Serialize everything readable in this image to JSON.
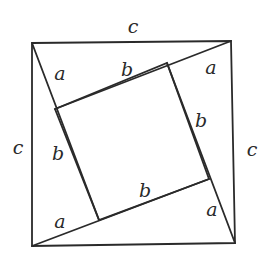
{
  "diagram": {
    "title": "",
    "stroke_color": "#2a2a2a",
    "background": "#ffffff",
    "outer_square": {
      "corners": [
        [
          32,
          43
        ],
        [
          231,
          41
        ],
        [
          235,
          243
        ],
        [
          32,
          246
        ]
      ]
    },
    "inner_square": {
      "corners": [
        [
          55,
          109
        ],
        [
          167,
          63
        ],
        [
          209,
          179
        ],
        [
          99,
          220
        ]
      ]
    },
    "segments": [
      {
        "name": "diag-top-left",
        "from": [
          32,
          43
        ],
        "to": [
          99,
          220
        ]
      },
      {
        "name": "diag-top-right",
        "from": [
          231,
          41
        ],
        "to": [
          55,
          109
        ]
      },
      {
        "name": "diag-right",
        "from": [
          167,
          63
        ],
        "to": [
          235,
          243
        ]
      },
      {
        "name": "diag-bottom",
        "from": [
          32,
          246
        ],
        "to": [
          209,
          179
        ]
      }
    ],
    "labels": [
      {
        "name": "label-c-top",
        "text": "c",
        "x": 133,
        "y": 33
      },
      {
        "name": "label-c-left",
        "text": "c",
        "x": 18,
        "y": 154
      },
      {
        "name": "label-c-right",
        "text": "c",
        "x": 252,
        "y": 156
      },
      {
        "name": "label-a-top-left",
        "text": "a",
        "x": 60,
        "y": 80
      },
      {
        "name": "label-a-top-right",
        "text": "a",
        "x": 211,
        "y": 74
      },
      {
        "name": "label-a-bottom-left",
        "text": "a",
        "x": 60,
        "y": 228
      },
      {
        "name": "label-a-bottom-right",
        "text": "a",
        "x": 212,
        "y": 216
      },
      {
        "name": "label-b-top",
        "text": "b",
        "x": 127,
        "y": 76
      },
      {
        "name": "label-b-left",
        "text": "b",
        "x": 58,
        "y": 160
      },
      {
        "name": "label-b-right",
        "text": "b",
        "x": 201,
        "y": 127
      },
      {
        "name": "label-b-bottom",
        "text": "b",
        "x": 145,
        "y": 197
      }
    ]
  }
}
